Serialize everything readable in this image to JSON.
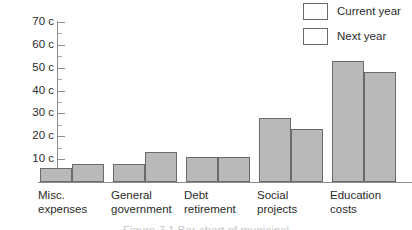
{
  "legend": {
    "position": "top-right",
    "swatch_color": "#b9b9b9",
    "entries": [
      {
        "label": "Current year"
      },
      {
        "label": "Next year"
      }
    ]
  },
  "axis": {
    "y_tick_labels": [
      "70 c",
      "60 c",
      "50 c",
      "40 c",
      "30 c",
      "20 c",
      "10 c"
    ],
    "y_tick_values": [
      70,
      60,
      50,
      40,
      30,
      20,
      10
    ]
  },
  "caption": {
    "cutoff_text": "Figure 7.1  Bar chart of municipal"
  },
  "chart_data": {
    "type": "bar",
    "title": "",
    "subtitle": "",
    "xlabel": "",
    "ylabel": "",
    "ylim": [
      0,
      70
    ],
    "ytick_step_major": 10,
    "ytick_step_minor": 5,
    "ytick_suffix": " c",
    "grid": false,
    "legend_position": "top-right",
    "categories": [
      "Misc. expenses",
      "General government",
      "Debt retirement",
      "Social projects",
      "Education costs"
    ],
    "category_lines": [
      [
        "Misc.",
        "expenses"
      ],
      [
        "General",
        "government"
      ],
      [
        "Debt",
        "retirement"
      ],
      [
        "Social",
        "projects"
      ],
      [
        "Education",
        "costs"
      ]
    ],
    "series": [
      {
        "name": "Current year",
        "color": "#b9b9b9",
        "values": [
          6,
          8,
          11,
          28,
          53
        ]
      },
      {
        "name": "Next year",
        "color": "#b9b9b9",
        "values": [
          8,
          13,
          11,
          23,
          48
        ]
      }
    ]
  }
}
